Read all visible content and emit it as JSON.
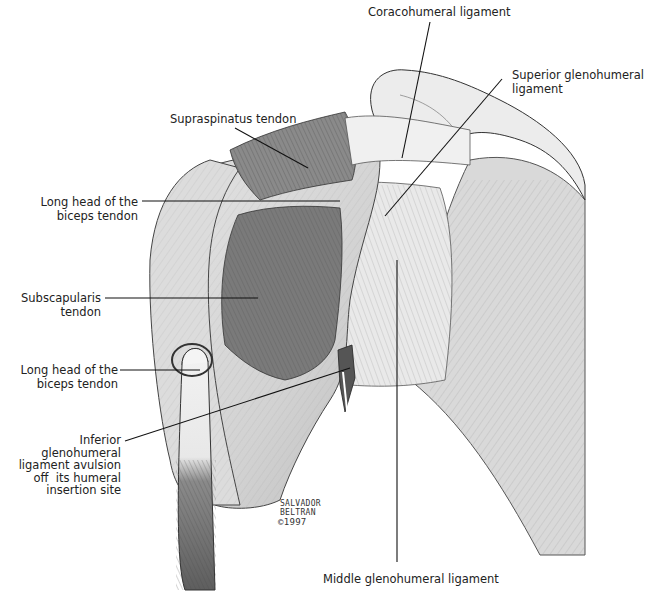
{
  "figure": {
    "labels": [
      {
        "id": "coracohumeral",
        "text": "Coracohumeral ligament"
      },
      {
        "id": "superior_gh",
        "text": "Superior glenohumeral\nligament"
      },
      {
        "id": "supraspinatus",
        "text": "Supraspinatus tendon"
      },
      {
        "id": "biceps_upper",
        "text": "Long head of the\nbiceps tendon"
      },
      {
        "id": "subscapularis",
        "text": "Subscapularis\ntendon"
      },
      {
        "id": "biceps_lower",
        "text": "Long head of the\nbiceps tendon"
      },
      {
        "id": "inferior_gh",
        "text": "Inferior\nglenohumeral\nligament avulsion\noff  its humeral\ninsertion site"
      },
      {
        "id": "middle_gh",
        "text": "Middle glenohumeral ligament"
      }
    ],
    "signature": {
      "artist": "SALVADOR\nBELTRAN",
      "copyright": "©1997"
    },
    "colors": {
      "background": "#ffffff",
      "ink": "#222222",
      "bone_light": "#e6e6e6",
      "bone_mid": "#c8c8c8",
      "tendon_dark": "#6a6a6a",
      "subscapularis": "#7a7a7a"
    }
  }
}
